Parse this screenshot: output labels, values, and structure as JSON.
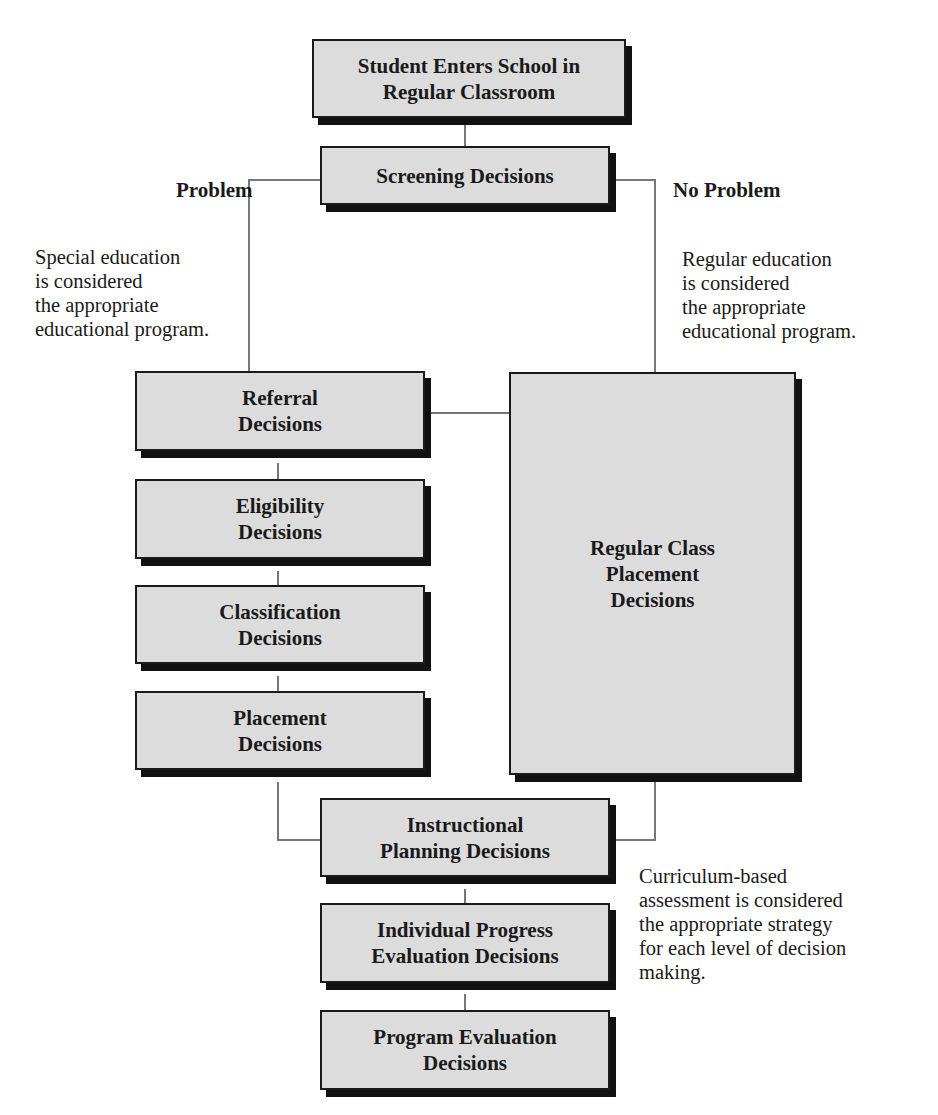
{
  "diagram": {
    "nodes": {
      "start": "Student Enters School in\nRegular Classroom",
      "screening": "Screening Decisions",
      "referral": "Referral\nDecisions",
      "eligibility": "Eligibility\nDecisions",
      "classification": "Classification\nDecisions",
      "placement": "Placement\nDecisions",
      "regular_class": "Regular Class\nPlacement\nDecisions",
      "instructional": "Instructional\nPlanning Decisions",
      "individual_progress": "Individual Progress\nEvaluation Decisions",
      "program_evaluation": "Program Evaluation\nDecisions"
    },
    "branch_labels": {
      "left": "Problem",
      "right": "No Problem"
    },
    "notes": {
      "left": "Special education\nis considered\nthe appropriate\neducational program.",
      "right": "Regular education\nis considered\nthe appropriate\neducational program.",
      "bottom_right": "Curriculum-based\nassessment is considered\nthe appropriate strategy\nfor each level of decision\nmaking."
    },
    "edges": [
      [
        "start",
        "screening"
      ],
      [
        "screening",
        "referral",
        "Problem"
      ],
      [
        "screening",
        "regular_class",
        "No Problem"
      ],
      [
        "referral",
        "regular_class"
      ],
      [
        "referral",
        "eligibility"
      ],
      [
        "eligibility",
        "classification"
      ],
      [
        "classification",
        "placement"
      ],
      [
        "placement",
        "instructional"
      ],
      [
        "regular_class",
        "instructional"
      ],
      [
        "instructional",
        "individual_progress"
      ],
      [
        "individual_progress",
        "program_evaluation"
      ]
    ]
  }
}
